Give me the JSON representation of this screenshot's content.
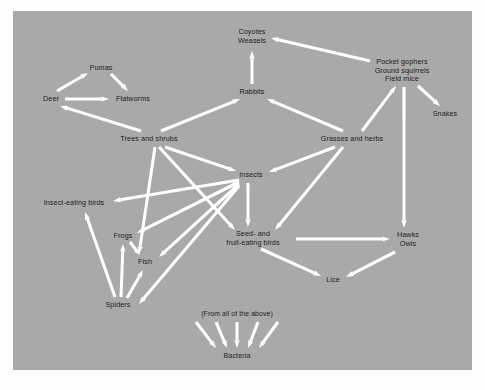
{
  "diagram": {
    "background_color": "#a9a9a9",
    "page_color": "#fdfdfd",
    "arrow_color": "#ffffff",
    "text_color": "#1c1c1c",
    "nodes": [
      {
        "id": "pumas",
        "label_lines": [
          "Pumas"
        ],
        "x": 88,
        "y": 57
      },
      {
        "id": "deer",
        "label_lines": [
          "Deer"
        ],
        "x": 38,
        "y": 88
      },
      {
        "id": "flatworms",
        "label_lines": [
          "Flatworms"
        ],
        "x": 120,
        "y": 88
      },
      {
        "id": "coyotes",
        "label_lines": [
          "Coyotes",
          "Weasels"
        ],
        "x": 239,
        "y": 26
      },
      {
        "id": "rabbits",
        "label_lines": [
          "Rabbits"
        ],
        "x": 239,
        "y": 81
      },
      {
        "id": "rodents",
        "label_lines": [
          "Pocket gophers",
          "Ground squirrels",
          "Field mice"
        ],
        "x": 389,
        "y": 60
      },
      {
        "id": "snakes",
        "label_lines": [
          "Snakes"
        ],
        "x": 432,
        "y": 103
      },
      {
        "id": "trees",
        "label_lines": [
          "Trees and shrubs"
        ],
        "x": 136,
        "y": 128
      },
      {
        "id": "grasses",
        "label_lines": [
          "Grasses and herbs"
        ],
        "x": 339,
        "y": 128
      },
      {
        "id": "insects",
        "label_lines": [
          "Insects"
        ],
        "x": 238,
        "y": 164
      },
      {
        "id": "insect_birds",
        "label_lines": [
          "Insect-eating birds"
        ],
        "x": 61,
        "y": 192
      },
      {
        "id": "frogs",
        "label_lines": [
          "Frogs"
        ],
        "x": 110,
        "y": 225
      },
      {
        "id": "fish",
        "label_lines": [
          "Fish"
        ],
        "x": 132,
        "y": 251
      },
      {
        "id": "spiders",
        "label_lines": [
          "Spiders"
        ],
        "x": 105,
        "y": 294
      },
      {
        "id": "seed_birds",
        "label_lines": [
          "Seed- and",
          "fruit-eating birds"
        ],
        "x": 240,
        "y": 228
      },
      {
        "id": "hawks",
        "label_lines": [
          "Hawks",
          "Owls"
        ],
        "x": 395,
        "y": 229
      },
      {
        "id": "lice",
        "label_lines": [
          "Lice"
        ],
        "x": 320,
        "y": 269
      },
      {
        "id": "from_above",
        "label_lines": [
          "(From all of the above)"
        ],
        "x": 224,
        "y": 303,
        "note": true
      },
      {
        "id": "bacteria",
        "label_lines": [
          "Bacteria"
        ],
        "x": 224,
        "y": 345
      }
    ],
    "edges": [
      {
        "from": "deer",
        "to": "pumas",
        "x1": 44,
        "y1": 80,
        "x2": 75,
        "y2": 62
      },
      {
        "from": "pumas",
        "to": "flatworms",
        "x1": 98,
        "y1": 63,
        "x2": 115,
        "y2": 80
      },
      {
        "from": "deer",
        "to": "flatworms",
        "x1": 52,
        "y1": 88,
        "x2": 96,
        "y2": 88
      },
      {
        "from": "trees",
        "to": "deer",
        "x1": 128,
        "y1": 120,
        "x2": 47,
        "y2": 95
      },
      {
        "from": "trees",
        "to": "rabbits",
        "x1": 148,
        "y1": 120,
        "x2": 227,
        "y2": 88
      },
      {
        "from": "grasses",
        "to": "rabbits",
        "x1": 330,
        "y1": 120,
        "x2": 254,
        "y2": 88
      },
      {
        "from": "rabbits",
        "to": "coyotes",
        "x1": 239,
        "y1": 73,
        "x2": 239,
        "y2": 40
      },
      {
        "from": "rodents",
        "to": "coyotes",
        "x1": 357,
        "y1": 50,
        "x2": 258,
        "y2": 27
      },
      {
        "from": "grasses",
        "to": "rodents",
        "x1": 349,
        "y1": 120,
        "x2": 383,
        "y2": 75
      },
      {
        "from": "rodents",
        "to": "snakes",
        "x1": 405,
        "y1": 75,
        "x2": 427,
        "y2": 95
      },
      {
        "from": "rodents",
        "to": "hawks",
        "x1": 391,
        "y1": 76,
        "x2": 391,
        "y2": 217
      },
      {
        "from": "trees",
        "to": "insects",
        "x1": 152,
        "y1": 136,
        "x2": 223,
        "y2": 160
      },
      {
        "from": "grasses",
        "to": "insects",
        "x1": 322,
        "y1": 136,
        "x2": 256,
        "y2": 161
      },
      {
        "from": "grasses",
        "to": "seed_birds",
        "x1": 330,
        "y1": 136,
        "x2": 262,
        "y2": 219
      },
      {
        "from": "insects",
        "to": "insect_birds",
        "x1": 226,
        "y1": 169,
        "x2": 100,
        "y2": 190
      },
      {
        "from": "insects",
        "to": "frogs",
        "x1": 226,
        "y1": 171,
        "x2": 124,
        "y2": 222
      },
      {
        "from": "insects",
        "to": "fish",
        "x1": 226,
        "y1": 173,
        "x2": 146,
        "y2": 246
      },
      {
        "from": "insects",
        "to": "spiders",
        "x1": 226,
        "y1": 175,
        "x2": 126,
        "y2": 293
      },
      {
        "from": "insects",
        "to": "seed_birds",
        "x1": 235,
        "y1": 172,
        "x2": 235,
        "y2": 216
      },
      {
        "from": "trees",
        "to": "seed_birds",
        "x1": 146,
        "y1": 136,
        "x2": 222,
        "y2": 219
      },
      {
        "from": "trees",
        "to": "fish",
        "x1": 142,
        "y1": 136,
        "x2": 126,
        "y2": 243
      },
      {
        "from": "spiders",
        "to": "insect_birds",
        "x1": 102,
        "y1": 286,
        "x2": 72,
        "y2": 201
      },
      {
        "from": "spiders",
        "to": "frogs",
        "x1": 108,
        "y1": 286,
        "x2": 110,
        "y2": 233
      },
      {
        "from": "spiders",
        "to": "fish",
        "x1": 114,
        "y1": 287,
        "x2": 130,
        "y2": 259
      },
      {
        "from": "frogs",
        "to": "fish",
        "x1": 117,
        "y1": 231,
        "x2": 127,
        "y2": 244
      },
      {
        "from": "seed_birds",
        "to": "hawks",
        "x1": 283,
        "y1": 228,
        "x2": 377,
        "y2": 228
      },
      {
        "from": "seed_birds",
        "to": "lice",
        "x1": 248,
        "y1": 238,
        "x2": 308,
        "y2": 265
      },
      {
        "from": "hawks",
        "to": "lice",
        "x1": 382,
        "y1": 241,
        "x2": 333,
        "y2": 266
      },
      {
        "from": "from_above",
        "to": "bacteria",
        "x1": 183,
        "y1": 311,
        "x2": 203,
        "y2": 337
      },
      {
        "from": "from_above",
        "to": "bacteria",
        "x1": 203,
        "y1": 311,
        "x2": 214,
        "y2": 337
      },
      {
        "from": "from_above",
        "to": "bacteria",
        "x1": 224,
        "y1": 311,
        "x2": 224,
        "y2": 337
      },
      {
        "from": "from_above",
        "to": "bacteria",
        "x1": 245,
        "y1": 311,
        "x2": 235,
        "y2": 337
      },
      {
        "from": "from_above",
        "to": "bacteria",
        "x1": 265,
        "y1": 311,
        "x2": 246,
        "y2": 337
      }
    ]
  }
}
